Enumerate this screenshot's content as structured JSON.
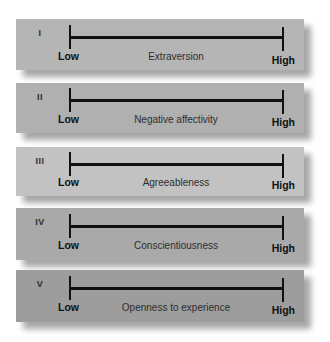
{
  "diagram": {
    "type": "big-five-personality-scales",
    "scale_low_label": "Low",
    "scale_high_label": "High",
    "panels": [
      {
        "numeral": "I",
        "trait": "Extraversion",
        "color": "#b5b5b5"
      },
      {
        "numeral": "II",
        "trait": "Negative affectivity",
        "color": "#b0b0b0"
      },
      {
        "numeral": "III",
        "trait": "Agreeableness",
        "color": "#c2c2c2"
      },
      {
        "numeral": "IV",
        "trait": "Conscientiousness",
        "color": "#a9a9a9"
      },
      {
        "numeral": "V",
        "trait": "Openness to experience",
        "color": "#9d9d9d"
      }
    ]
  }
}
